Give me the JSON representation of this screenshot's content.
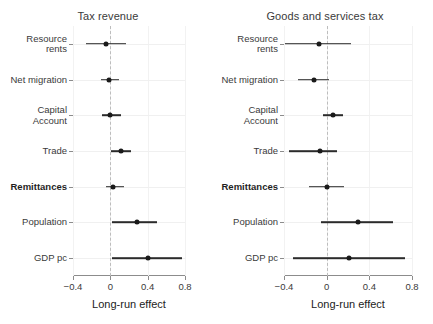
{
  "figure": {
    "background": "#ffffff",
    "point_color": "#1a1a1a",
    "line_color": "#2b2b2b",
    "zero_line_color": "#bdbdbd"
  },
  "chart_data": [
    {
      "type": "scatter",
      "subtype": "coefficient-forest-plot",
      "title": "Tax revenue",
      "xlabel": "Long-run effect",
      "ylabel": "",
      "xlim": [
        -0.4,
        0.8
      ],
      "xticks": [
        -0.4,
        0,
        0.4,
        0.8
      ],
      "xticklabels": [
        "−0.4",
        "0",
        "0.4",
        "0.8"
      ],
      "grid": true,
      "zero_reference": 0,
      "categories": [
        "Resource\nrents",
        "Net migration",
        "Capital\nAccount",
        "Trade",
        "Remittances",
        "Population",
        "GDP pc"
      ],
      "highlight_category": "Remittances",
      "estimates": [
        -0.05,
        -0.01,
        0.0,
        0.11,
        0.03,
        0.29,
        0.4
      ],
      "ci_low": [
        -0.26,
        -0.1,
        -0.09,
        0.01,
        -0.05,
        0.02,
        0.02
      ],
      "ci_high": [
        0.17,
        0.09,
        0.11,
        0.22,
        0.15,
        0.5,
        0.77
      ]
    },
    {
      "type": "scatter",
      "subtype": "coefficient-forest-plot",
      "title": "Goods and services tax",
      "xlabel": "Long-run effect",
      "ylabel": "",
      "xlim": [
        -0.4,
        0.8
      ],
      "xticks": [
        -0.4,
        0,
        0.4,
        0.8
      ],
      "xticklabels": [
        "−0.4",
        "0",
        "0.4",
        "0.8"
      ],
      "grid": true,
      "zero_reference": 0,
      "categories": [
        "Resource\nrents",
        "Net migration",
        "Capital\nAccount",
        "Trade",
        "Remittances",
        "Population",
        "GDP pc"
      ],
      "highlight_category": "Remittances",
      "estimates": [
        -0.07,
        -0.12,
        0.06,
        -0.06,
        0.0,
        0.29,
        0.21
      ],
      "ci_low": [
        -0.39,
        -0.27,
        -0.03,
        -0.35,
        -0.17,
        -0.05,
        -0.32
      ],
      "ci_high": [
        0.23,
        0.02,
        0.15,
        0.1,
        0.16,
        0.62,
        0.73
      ]
    }
  ],
  "panels": [
    {
      "id": "tax-revenue",
      "title": "Tax revenue"
    },
    {
      "id": "goods-and-services-tax",
      "title": "Goods and services tax"
    }
  ]
}
